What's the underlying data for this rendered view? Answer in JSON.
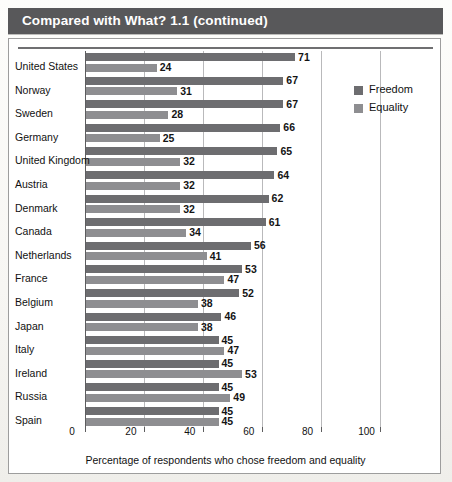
{
  "banner": {
    "title": "Compared with What? 1.1 (continued)"
  },
  "legend": {
    "items": [
      {
        "label": "Freedom",
        "color": "#6d6d70",
        "icon": "legend-swatch-icon"
      },
      {
        "label": "Equality",
        "color": "#8e8e91",
        "icon": "legend-swatch-icon"
      }
    ]
  },
  "chart_data": {
    "type": "bar",
    "orientation": "horizontal",
    "title": "Compared with What? 1.1 (continued)",
    "xlabel": "Percentage of respondents who chose freedom and equality",
    "ylabel": "",
    "xlim": [
      0,
      110
    ],
    "xticks": [
      0,
      20,
      40,
      60,
      80,
      100
    ],
    "xticklabels": [
      "0",
      "20",
      "40",
      "60",
      "80",
      "100"
    ],
    "grid": true,
    "legend_position": "right",
    "categories": [
      "United States",
      "Norway",
      "Sweden",
      "Germany",
      "United Kingdom",
      "Austria",
      "Denmark",
      "Canada",
      "Netherlands",
      "France",
      "Belgium",
      "Japan",
      "Italy",
      "Ireland",
      "Russia",
      "Spain"
    ],
    "series": [
      {
        "name": "Freedom",
        "color": "#6d6d70",
        "values": [
          71,
          67,
          67,
          66,
          65,
          64,
          62,
          61,
          56,
          53,
          52,
          46,
          45,
          45,
          45,
          45
        ]
      },
      {
        "name": "Equality",
        "color": "#8e8e91",
        "values": [
          24,
          31,
          28,
          25,
          32,
          32,
          32,
          34,
          41,
          47,
          38,
          38,
          47,
          53,
          49,
          45
        ]
      }
    ]
  }
}
